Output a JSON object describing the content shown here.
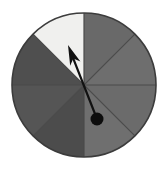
{
  "figure": {
    "name": "spinner-wheel",
    "type": "probability-spinner",
    "background_color": "#ffffff",
    "width": 168,
    "height": 169
  },
  "wheel": {
    "center_x": 84,
    "center_y": 85,
    "radius": 72,
    "sector_count": 8,
    "sector_angle_degrees": 45,
    "outline_color": "#3c3c3c",
    "outline_width": 1.6,
    "divider_color": "#4a4a4a",
    "divider_width": 1.2,
    "sectors": [
      {
        "index": 1,
        "label": "",
        "start_deg": 90,
        "end_deg": 135,
        "color": "#f0f0ee",
        "shade": "light"
      },
      {
        "index": 2,
        "label": "",
        "start_deg": 135,
        "end_deg": 180,
        "color": "#4f4f4f",
        "shade": "dark"
      },
      {
        "index": 3,
        "label": "",
        "start_deg": 180,
        "end_deg": 225,
        "color": "#555555",
        "shade": "dark"
      },
      {
        "index": 4,
        "label": "",
        "start_deg": 225,
        "end_deg": 270,
        "color": "#4c4c4c",
        "shade": "dark"
      },
      {
        "index": 5,
        "label": "",
        "start_deg": 270,
        "end_deg": 315,
        "color": "#6f6f6f",
        "shade": "medium"
      },
      {
        "index": 6,
        "label": "",
        "start_deg": 315,
        "end_deg": 360,
        "color": "#6b6b6b",
        "shade": "medium"
      },
      {
        "index": 7,
        "label": "",
        "start_deg": 0,
        "end_deg": 45,
        "color": "#6e6e6e",
        "shade": "medium"
      },
      {
        "index": 8,
        "label": "",
        "start_deg": 45,
        "end_deg": 90,
        "color": "#696969",
        "shade": "medium"
      }
    ]
  },
  "pointer": {
    "name": "spinner-arrow",
    "color": "#111111",
    "tip_x": 68,
    "tip_y": 45,
    "tail_x": 97,
    "tail_y": 119,
    "shaft_width": 2.2,
    "arrowhead_length": 20,
    "arrowhead_width": 11,
    "direction_deg": 112,
    "points_to_sector": 1,
    "pivot": {
      "name": "pivot-dot",
      "x": 97,
      "y": 119,
      "radius": 6.5,
      "color": "#0d0d0d"
    }
  },
  "chart_data": {
    "type": "pie",
    "title": "",
    "categories": [
      "1",
      "2",
      "3",
      "4",
      "5",
      "6",
      "7",
      "8"
    ],
    "values": [
      12.5,
      12.5,
      12.5,
      12.5,
      12.5,
      12.5,
      12.5,
      12.5
    ],
    "colors": [
      "#f0f0ee",
      "#4f4f4f",
      "#555555",
      "#4c4c4c",
      "#6f6f6f",
      "#6b6b6b",
      "#6e6e6e",
      "#696969"
    ],
    "legend": "none",
    "grid": false,
    "annotations": [
      "arrow pointing up-left toward the light sector"
    ]
  }
}
